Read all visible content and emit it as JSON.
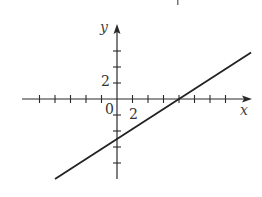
{
  "chart_data": {
    "type": "line",
    "title": "",
    "xlabel": "x",
    "ylabel": "y",
    "origin_label": "0",
    "x_tick_label": "2",
    "y_tick_label": "2",
    "tick_interval": 2,
    "xlim": [
      -12,
      18
    ],
    "ylim": [
      -10,
      9
    ],
    "x_ticks": [
      -10,
      -8,
      -6,
      -4,
      -2,
      2,
      4,
      6,
      8,
      10,
      12,
      14
    ],
    "y_ticks": [
      -8,
      -6,
      -4,
      -2,
      2,
      4,
      6
    ],
    "grid": false,
    "legend": null,
    "series": [
      {
        "name": "line",
        "equation": "y = (5/8)x - 5",
        "x_intercept": 8,
        "y_intercept": -5,
        "x": [
          -8,
          17.3
        ],
        "y": [
          -10,
          5.8
        ]
      }
    ],
    "colors": {
      "axis": "#2a2a2a",
      "line": "#222222",
      "background": "#ffffff"
    }
  }
}
